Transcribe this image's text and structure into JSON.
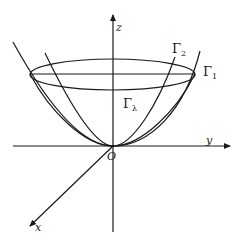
{
  "diagram": {
    "type": "3d-coordinate-sketch",
    "axes": {
      "z_label": "z",
      "y_label": "y",
      "x_label": "x",
      "origin_label": "O"
    },
    "curves": {
      "gamma1": {
        "symbol": "Γ",
        "subscript": "1"
      },
      "gamma2": {
        "symbol": "Γ",
        "subscript": "2"
      },
      "gamma_lambda": {
        "symbol": "Γ",
        "subscript": "λ"
      }
    },
    "colors": {
      "stroke": "#1a1a1a",
      "background": "#ffffff"
    }
  }
}
